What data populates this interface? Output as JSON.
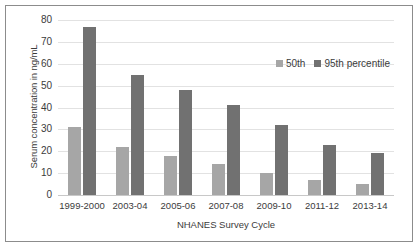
{
  "chart_data": {
    "type": "bar",
    "title": "",
    "xlabel": "NHANES Survey Cycle",
    "ylabel": "Serum concentration in ng/mL",
    "ylim": [
      0,
      80
    ],
    "yticks": [
      0,
      10,
      20,
      30,
      40,
      50,
      60,
      70,
      80
    ],
    "grid": true,
    "legend_position": "top-right",
    "categories": [
      "1999-2000",
      "2003-04",
      "2005-06",
      "2007-08",
      "2009-10",
      "2011-12",
      "2013-14"
    ],
    "series": [
      {
        "name": "50th",
        "color": "#a6a6a6",
        "values": [
          31,
          22,
          18,
          14,
          10,
          7,
          5
        ]
      },
      {
        "name": "95th percentile",
        "color": "#717171",
        "values": [
          77,
          55,
          48,
          41,
          32,
          23,
          19
        ]
      }
    ]
  },
  "figure": {
    "border_color": "#8c8c8c",
    "background": "#ffffff"
  }
}
